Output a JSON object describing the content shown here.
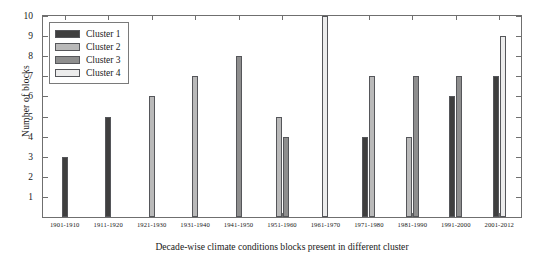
{
  "chart_data": {
    "type": "bar",
    "title": "",
    "xlabel": "Decade-wise climate conditions blocks present in different cluster",
    "ylabel": "Number of blocks",
    "ylim": [
      0,
      10
    ],
    "yticks": [
      0,
      1,
      2,
      3,
      4,
      5,
      6,
      7,
      8,
      9,
      10
    ],
    "grid": false,
    "legend_position": "upper left",
    "categories": [
      "1901-1910",
      "1911-1920",
      "1921-1930",
      "1931-1940",
      "1941-1950",
      "1951-1960",
      "1961-1970",
      "1971-1980",
      "1981-1990",
      "1991-2000",
      "2001-2012"
    ],
    "series": [
      {
        "name": "Cluster 1",
        "color": "#3f3f3f",
        "values": [
          3,
          5,
          0,
          0,
          0,
          0,
          0,
          4,
          0,
          6,
          7
        ]
      },
      {
        "name": "Cluster 2",
        "color": "#b9b9b9",
        "values": [
          0,
          0,
          6,
          7,
          0,
          5,
          0,
          7,
          4,
          0,
          0
        ]
      },
      {
        "name": "Cluster 3",
        "color": "#8e8e8e",
        "values": [
          0,
          0,
          0,
          0,
          8,
          4,
          0,
          0,
          7,
          7,
          0
        ]
      },
      {
        "name": "Cluster 4",
        "color": "#ececec",
        "values": [
          0,
          0,
          0,
          0,
          0,
          0,
          10,
          0,
          0,
          0,
          9
        ]
      }
    ]
  },
  "legend": {
    "items": [
      {
        "label": "Cluster 1"
      },
      {
        "label": "Cluster 2"
      },
      {
        "label": "Cluster 3"
      },
      {
        "label": "Cluster 4"
      }
    ]
  },
  "axes": {
    "y_title": "Number of blocks",
    "x_title": "Decade-wise climate conditions blocks present in different cluster",
    "y_tick_labels": [
      "0",
      "1",
      "2",
      "3",
      "4",
      "5",
      "6",
      "7",
      "8",
      "9",
      "10"
    ],
    "x_tick_labels": [
      "1901-1910",
      "1911-1920",
      "1921-1930",
      "1931-1940",
      "1941-1950",
      "1951-1960",
      "1961-1970",
      "1971-1980",
      "1981-1990",
      "1991-2000",
      "2001-2012"
    ]
  },
  "style": {
    "axis_color": "#6f6f6f",
    "bar_edge_color": "#55565a",
    "background": "#ffffff"
  }
}
